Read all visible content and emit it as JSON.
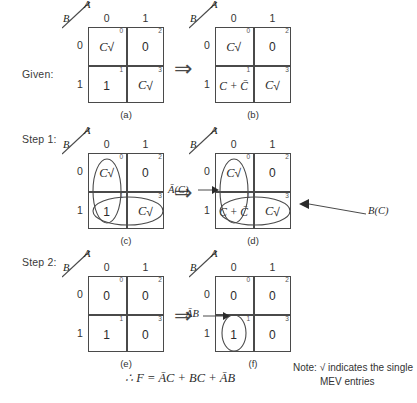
{
  "steps": {
    "given_label": "Given:",
    "step1_label": "Step 1:",
    "step2_label": "Step 2:"
  },
  "axis": {
    "a_label": "A",
    "b_label": "B",
    "col_0": "0",
    "col_1": "1",
    "row_0": "0",
    "row_1": "1"
  },
  "implies_symbol": "⇒",
  "check_symbol": "√",
  "maps": {
    "a": {
      "caption": "(a)",
      "cells": [
        {
          "index": "0",
          "value": "C",
          "check": true,
          "italic": true
        },
        {
          "index": "2",
          "value": "0",
          "check": false,
          "italic": false
        },
        {
          "index": "1",
          "value": "1",
          "check": false,
          "italic": false
        },
        {
          "index": "3",
          "value": "C",
          "check": true,
          "italic": true
        }
      ]
    },
    "b": {
      "caption": "(b)",
      "cells": [
        {
          "index": "0",
          "value": "C",
          "check": true,
          "italic": true
        },
        {
          "index": "2",
          "value": "0",
          "check": false,
          "italic": false
        },
        {
          "index": "1",
          "value": "C + C̄",
          "check": false,
          "italic": true
        },
        {
          "index": "3",
          "value": "C",
          "check": true,
          "italic": true
        }
      ]
    },
    "c": {
      "caption": "(c)",
      "cells": [
        {
          "index": "0",
          "value": "C",
          "check": true,
          "italic": true
        },
        {
          "index": "2",
          "value": "0",
          "check": false,
          "italic": false
        },
        {
          "index": "1",
          "value": "1",
          "check": false,
          "italic": false
        },
        {
          "index": "3",
          "value": "C",
          "check": true,
          "italic": true
        }
      ]
    },
    "d": {
      "caption": "(d)",
      "cells": [
        {
          "index": "0",
          "value": "C",
          "check": true,
          "italic": true
        },
        {
          "index": "2",
          "value": "0",
          "check": false,
          "italic": false
        },
        {
          "index": "1",
          "value": "C + C̄",
          "check": false,
          "italic": true
        },
        {
          "index": "3",
          "value": "C",
          "check": true,
          "italic": true
        }
      ]
    },
    "e": {
      "caption": "(e)",
      "cells": [
        {
          "index": "0",
          "value": "0",
          "check": false,
          "italic": false
        },
        {
          "index": "2",
          "value": "0",
          "check": false,
          "italic": false
        },
        {
          "index": "1",
          "value": "1",
          "check": false,
          "italic": false
        },
        {
          "index": "3",
          "value": "0",
          "check": false,
          "italic": false
        }
      ]
    },
    "f": {
      "caption": "(f)",
      "cells": [
        {
          "index": "0",
          "value": "0",
          "check": false,
          "italic": false
        },
        {
          "index": "2",
          "value": "0",
          "check": false,
          "italic": false
        },
        {
          "index": "1",
          "value": "1",
          "check": false,
          "italic": false
        },
        {
          "index": "3",
          "value": "0",
          "check": false,
          "italic": false
        }
      ]
    }
  },
  "annotations": {
    "a_bar_c": "Ā(C)",
    "b_c": "B(C)",
    "a_bar_b": "ĀB"
  },
  "formula": "∴ F = ĀC + BC + ĀB",
  "note": {
    "line1": "Note: √ indicates the single",
    "line2": "MEV entries"
  }
}
